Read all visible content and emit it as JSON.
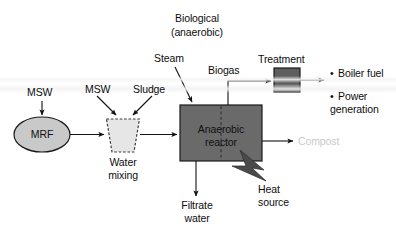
{
  "diagram": {
    "title_line1": "Biological",
    "title_line2": "(anaerobic)",
    "nodes": {
      "mrf": {
        "label": "MRF",
        "shape": "ellipse",
        "fill": "#c9c9c9",
        "stroke": "#1a1a1a"
      },
      "water_mixing": {
        "label_line1": "Water",
        "label_line2": "mixing",
        "shape": "trapezoid-dashed",
        "fill": "#e6e6e6",
        "stroke": "#3a3a3a"
      },
      "reactor": {
        "label_line1": "Anaerobic",
        "label_line2": "reactor",
        "shape": "rect",
        "fill": "#6a6a6a",
        "stroke": "#1a1a1a"
      },
      "treatment": {
        "label": "Treatment",
        "shape": "rect",
        "fill": "#5e5e5e",
        "stroke": "#1a1a1a"
      }
    },
    "flow_labels": {
      "msw_to_mrf": "MSW",
      "msw_to_mixing": "MSW",
      "sludge": "Sludge",
      "steam": "Steam",
      "biogas": "Biogas",
      "compost": "Compost",
      "filtrate_line1": "Filtrate",
      "filtrate_line2": "water",
      "heat_line1": "Heat",
      "heat_line2": "source"
    },
    "outputs": [
      {
        "bullet": "•",
        "line1": "Boiler fuel",
        "line2": ""
      },
      {
        "bullet": "•",
        "line1": "Power",
        "line2": "generation"
      }
    ],
    "colors": {
      "line": "#111111",
      "compost_text": "#c9c9c9",
      "reactor_fill": "#6a6a6a",
      "treatment_fill": "#5e5e5e",
      "mrf_fill": "#c9c9c9",
      "mixing_fill": "#e6e6e6"
    }
  }
}
